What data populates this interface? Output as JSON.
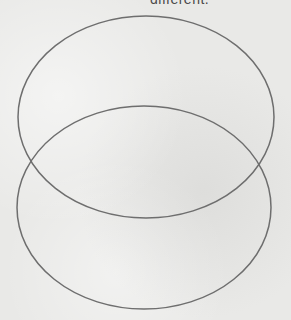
{
  "caption": "different.",
  "diagram": {
    "type": "venn",
    "shapes": [
      {
        "name": "top-ellipse",
        "stroke": "#6e6e6e"
      },
      {
        "name": "bottom-ellipse",
        "stroke": "#6e6e6e"
      }
    ],
    "background": "#e9e9e7"
  }
}
